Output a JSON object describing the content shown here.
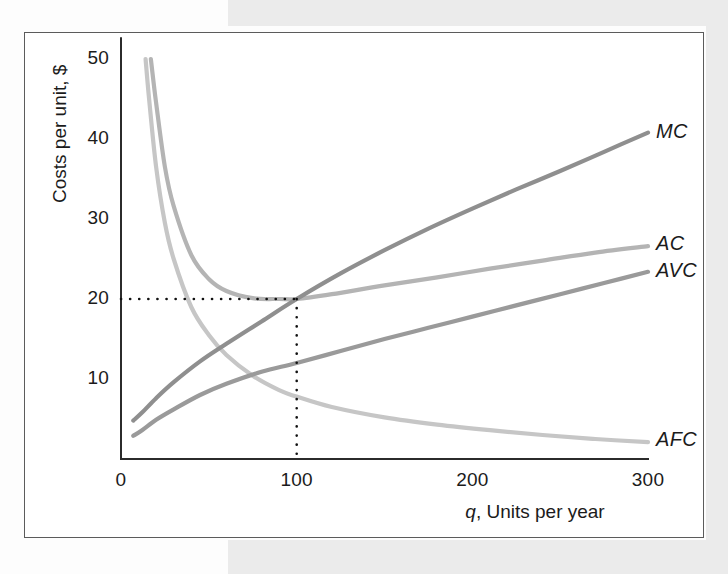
{
  "figure": {
    "kind": "economics-cost-curves-figure",
    "frame_border_color": "#5b5b5b",
    "background_color": "#ffffff"
  },
  "chart_data": {
    "type": "line",
    "title": "",
    "xlabel": "q, Units per year",
    "xlabel_italic_part": "q",
    "xlabel_rest": ", Units per year",
    "ylabel": "Costs per unit, $",
    "xlim": [
      0,
      300
    ],
    "ylim": [
      0,
      52
    ],
    "xticks": [
      0,
      100,
      200,
      300
    ],
    "xtick_labels": [
      "0",
      "100",
      "200",
      "300"
    ],
    "yticks": [
      10,
      20,
      30,
      40,
      50
    ],
    "ytick_labels": [
      "10",
      "20",
      "30",
      "40",
      "50"
    ],
    "grid": false,
    "legend": "inline-curve-labels",
    "annotations": [
      {
        "name": "minimum-average-cost-guides",
        "style": "dotted",
        "x": 100,
        "y": 20,
        "description": "dotted horizontal at $20 and vertical at q = 100 meeting where MC crosses the minimum of AC"
      }
    ],
    "series": [
      {
        "name": "MC",
        "label": "MC",
        "color": "#8f8f8f",
        "x": [
          7,
          12,
          20,
          30,
          45,
          60,
          80,
          100,
          125,
          150,
          175,
          200,
          225,
          250,
          275,
          300
        ],
        "y": [
          4.8,
          5.8,
          7.6,
          9.6,
          12.2,
          14.4,
          17.2,
          20.0,
          23.2,
          26.1,
          28.8,
          31.3,
          33.7,
          36.0,
          38.4,
          40.8
        ]
      },
      {
        "name": "AC",
        "label": "AC",
        "color": "#b4b4b4",
        "x": [
          17,
          20,
          25,
          30,
          40,
          50,
          60,
          75,
          90,
          100,
          120,
          150,
          180,
          210,
          240,
          270,
          300
        ],
        "y": [
          50.0,
          44.5,
          36.5,
          31.6,
          25.5,
          22.5,
          21.0,
          20.1,
          20.0,
          20.0,
          20.6,
          21.7,
          22.7,
          23.8,
          24.8,
          25.8,
          26.6
        ]
      },
      {
        "name": "AVC",
        "label": "AVC",
        "color": "#9a9a9a",
        "x": [
          7,
          12,
          20,
          30,
          45,
          60,
          80,
          100,
          125,
          150,
          175,
          200,
          225,
          250,
          275,
          300
        ],
        "y": [
          2.9,
          3.6,
          4.9,
          6.2,
          8.0,
          9.4,
          10.9,
          12.0,
          13.5,
          15.0,
          16.4,
          17.8,
          19.2,
          20.6,
          22.0,
          23.4
        ]
      },
      {
        "name": "AFC",
        "label": "AFC",
        "color": "#c6c6c6",
        "x": [
          14,
          16,
          20,
          25,
          30,
          40,
          50,
          60,
          75,
          90,
          100,
          120,
          150,
          180,
          210,
          240,
          270,
          300
        ],
        "y": [
          50.0,
          45.0,
          36.5,
          29.5,
          25.0,
          19.0,
          15.5,
          13.0,
          10.4,
          8.6,
          7.8,
          6.5,
          5.2,
          4.3,
          3.6,
          3.0,
          2.5,
          2.1
        ]
      }
    ]
  },
  "labels": {
    "mc": "MC",
    "ac": "AC",
    "avc": "AVC",
    "afc": "AFC"
  },
  "axis_titles": {
    "y": "Costs per unit, $",
    "x_italic": "q",
    "x_rest": ", Units per year"
  },
  "ticks": {
    "y": [
      "50",
      "40",
      "30",
      "20",
      "10"
    ],
    "x": [
      "0",
      "100",
      "200",
      "300"
    ]
  }
}
